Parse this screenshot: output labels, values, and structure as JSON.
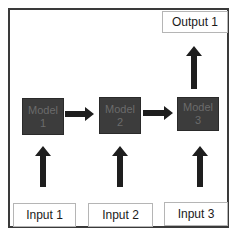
{
  "diagram": {
    "output": {
      "label": "Output 1"
    },
    "models": [
      {
        "line1": "Model",
        "line2": "1"
      },
      {
        "line1": "Model",
        "line2": "2"
      },
      {
        "line1": "Model",
        "line2": "3"
      }
    ],
    "inputs": [
      {
        "label": "Input 1"
      },
      {
        "label": "Input 2"
      },
      {
        "label": "Input 3"
      }
    ],
    "colors": {
      "model_fill": "#3c3c3c",
      "model_text": "#6b6b6b",
      "arrow": "#1e1e1e",
      "frame": "#3a3a3a",
      "box_border": "#b5b5b5"
    }
  }
}
